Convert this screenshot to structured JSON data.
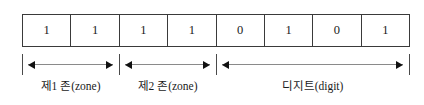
{
  "diagram": {
    "bits": [
      {
        "value": "1"
      },
      {
        "value": "1"
      },
      {
        "value": "1"
      },
      {
        "value": "1"
      },
      {
        "value": "0"
      },
      {
        "value": "1"
      },
      {
        "value": "0"
      },
      {
        "value": "1"
      }
    ],
    "segments": [
      {
        "label": "제1 존(zone)",
        "start_bit": 1,
        "end_bit": 2
      },
      {
        "label": "제2 존(zone)",
        "start_bit": 3,
        "end_bit": 4
      },
      {
        "label": "디지트(digit)",
        "start_bit": 5,
        "end_bit": 8
      }
    ],
    "colors": {
      "cell_border": "#3a3a3a",
      "tick": "#4a4a4a",
      "arrow_shaft": "#8a8a8a",
      "arrow_head": "#111111",
      "text": "#1a1a1a",
      "background": "#ffffff"
    }
  }
}
